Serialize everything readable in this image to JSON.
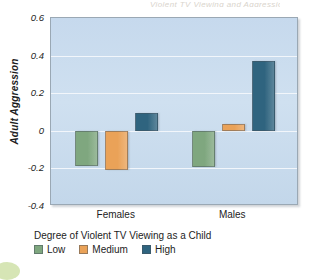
{
  "title_remnant": "Violent TV Viewing and Aggression",
  "chart_data": {
    "type": "bar",
    "title": "",
    "xlabel": "Degree of Violent TV Viewing as a Child",
    "ylabel": "Adult Aggression",
    "categories": [
      "Females",
      "Males"
    ],
    "ylim": [
      -0.4,
      0.6
    ],
    "yticks": [
      "0.6",
      "0.4",
      "0.2",
      "0",
      "-0.2",
      "-0.4"
    ],
    "ytick_values": [
      0.6,
      0.4,
      0.2,
      0,
      -0.2,
      -0.4
    ],
    "grid": true,
    "legend_position": "bottom",
    "series": [
      {
        "name": "Low",
        "color": "#7fa77f",
        "values": [
          -0.185,
          -0.195
        ]
      },
      {
        "name": "Medium",
        "color": "#eaa258",
        "values": [
          -0.21,
          0.035
        ]
      },
      {
        "name": "High",
        "color": "#2f647f",
        "values": [
          0.095,
          0.37
        ]
      }
    ]
  },
  "legend": {
    "title": "Degree of Violent TV Viewing as a Child",
    "items": [
      {
        "label": "Low",
        "color": "#7fa77f"
      },
      {
        "label": "Medium",
        "color": "#eaa258"
      },
      {
        "label": "High",
        "color": "#2f647f"
      }
    ]
  },
  "axes": {
    "y_title": "Adult Aggression",
    "x_categories": [
      "Females",
      "Males"
    ]
  },
  "colors": {
    "plot_background": "#cbdcee",
    "gridline": "#f2f6fb",
    "frame": "#9aa8b4",
    "text": "#1d1d1d"
  }
}
